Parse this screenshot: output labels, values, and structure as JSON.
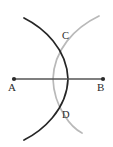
{
  "figure": {
    "background_color": "#ffffff",
    "width": 113,
    "height": 147,
    "segment": {
      "name": "AB",
      "color": "#555555",
      "stroke_width": 1.6,
      "endpoint_dot_color": "#2b2b2b",
      "endpoint_dot_radius": 2.1,
      "a": {
        "x": 14,
        "y": 79
      },
      "b": {
        "x": 103,
        "y": 79
      }
    },
    "arcs": [
      {
        "name": "arc-centered-at-A",
        "center": "A",
        "color": "#262626",
        "stroke_width": 1.7,
        "radius": 54,
        "crosses_segment_at_x": 68
      },
      {
        "name": "arc-centered-at-B",
        "center": "B",
        "color": "#b9b9b9",
        "stroke_width": 1.7,
        "radius": 50,
        "crosses_segment_at_x": 53
      }
    ],
    "intersections": [
      {
        "label": "C",
        "x": 57,
        "y": 36
      },
      {
        "label": "D",
        "x": 57,
        "y": 115
      }
    ],
    "labels": [
      {
        "name": "A",
        "text": "A",
        "x": 9,
        "y": 83
      },
      {
        "name": "B",
        "text": "B",
        "x": 98,
        "y": 83
      },
      {
        "name": "C",
        "text": "C",
        "x": 62,
        "y": 33
      },
      {
        "name": "D",
        "text": "D",
        "x": 62,
        "y": 111
      }
    ]
  }
}
